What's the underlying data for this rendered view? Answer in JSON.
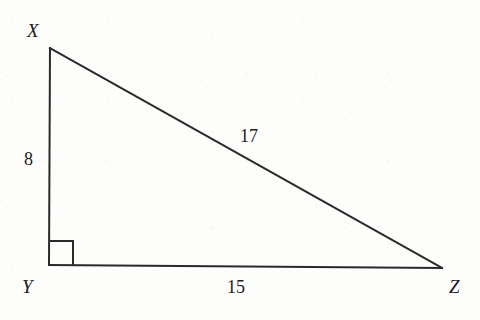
{
  "figure": {
    "kind": "right-triangle-diagram",
    "stroke_color": "#2a2a2a",
    "background_color": "#fdfdfc",
    "vertices": [
      {
        "name": "X",
        "label": "X",
        "x": 50,
        "y": 48
      },
      {
        "name": "Y",
        "label": "Y",
        "x": 49,
        "y": 265
      },
      {
        "name": "Z",
        "label": "Z",
        "x": 442,
        "y": 268
      }
    ],
    "sides": [
      {
        "name": "XY",
        "label": "8",
        "from": "X",
        "to": "Y",
        "role": "leg"
      },
      {
        "name": "YZ",
        "label": "15",
        "from": "Y",
        "to": "Z",
        "role": "leg"
      },
      {
        "name": "XZ",
        "label": "17",
        "from": "X",
        "to": "Z",
        "role": "hypotenuse"
      }
    ],
    "right_angle": {
      "at_vertex": "Y",
      "marker": "square",
      "size": 23
    }
  }
}
